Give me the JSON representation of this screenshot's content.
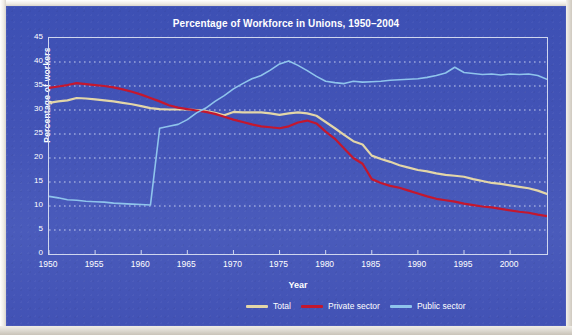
{
  "panel": {
    "background_color": "#4253b6",
    "frame_color": "#cfd6ef",
    "grid_color": "#ccd5f2"
  },
  "chart_data": {
    "type": "line",
    "title": "Percentage of Workforce in Unions, 1950–2004",
    "xlabel": "Year",
    "ylabel": "Percentage of workers",
    "xlim": [
      1950,
      2004
    ],
    "ylim": [
      0,
      45
    ],
    "ytick_labels": [
      "0",
      "5",
      "10",
      "15",
      "20",
      "25",
      "30",
      "35",
      "40",
      "45"
    ],
    "ytick_values": [
      0,
      5,
      10,
      15,
      20,
      25,
      30,
      35,
      40,
      45
    ],
    "xtick_labels": [
      "1950",
      "1955",
      "1960",
      "1965",
      "1970",
      "1975",
      "1980",
      "1985",
      "1990",
      "1995",
      "2000"
    ],
    "xtick_values": [
      1950,
      1955,
      1960,
      1965,
      1970,
      1975,
      1980,
      1985,
      1990,
      1995,
      2000
    ],
    "grid": "horizontal-dotted",
    "legend_position": "below-right",
    "x": [
      1950,
      1951,
      1952,
      1953,
      1954,
      1955,
      1956,
      1957,
      1958,
      1959,
      1960,
      1961,
      1962,
      1963,
      1964,
      1965,
      1966,
      1967,
      1968,
      1969,
      1970,
      1971,
      1972,
      1973,
      1974,
      1975,
      1976,
      1977,
      1978,
      1979,
      1980,
      1981,
      1982,
      1983,
      1984,
      1985,
      1986,
      1987,
      1988,
      1989,
      1990,
      1991,
      1992,
      1993,
      1994,
      1995,
      1996,
      1997,
      1998,
      1999,
      2000,
      2001,
      2002,
      2003,
      2004
    ],
    "series": [
      {
        "name": "Total",
        "color": "#e3d6a8",
        "values": [
          31.5,
          31.8,
          32.0,
          32.5,
          32.4,
          32.2,
          32.0,
          31.8,
          31.5,
          31.2,
          30.8,
          30.4,
          30.2,
          30.1,
          30.1,
          30.1,
          30.0,
          29.8,
          29.4,
          28.9,
          29.6,
          29.5,
          29.5,
          29.5,
          29.3,
          29.0,
          29.3,
          29.5,
          29.3,
          28.8,
          27.5,
          26.2,
          24.8,
          23.5,
          22.8,
          20.5,
          19.8,
          19.2,
          18.5,
          18.0,
          17.5,
          17.2,
          16.8,
          16.5,
          16.3,
          16.1,
          15.6,
          15.2,
          14.8,
          14.6,
          14.3,
          14.0,
          13.7,
          13.2,
          12.5
        ]
      },
      {
        "name": "Private sector",
        "color": "#c4172e",
        "values": [
          34.6,
          34.9,
          35.2,
          35.6,
          35.4,
          35.2,
          35.0,
          34.7,
          34.3,
          33.8,
          33.2,
          32.5,
          31.8,
          31.0,
          30.5,
          30.2,
          29.9,
          29.6,
          29.2,
          28.6,
          28.0,
          27.5,
          27.0,
          26.6,
          26.4,
          26.2,
          26.6,
          27.4,
          27.8,
          27.2,
          25.5,
          24.0,
          22.0,
          20.0,
          18.8,
          15.6,
          14.8,
          14.2,
          13.8,
          13.2,
          12.6,
          12.0,
          11.5,
          11.2,
          10.9,
          10.5,
          10.2,
          9.9,
          9.7,
          9.4,
          9.1,
          8.8,
          8.6,
          8.2,
          7.9
        ]
      },
      {
        "name": "Public sector",
        "color": "#8fc4ec",
        "values": [
          12.0,
          11.7,
          11.3,
          11.2,
          11.0,
          10.9,
          10.8,
          10.6,
          10.5,
          10.4,
          10.3,
          10.2,
          26.2,
          26.6,
          27.0,
          28.0,
          29.4,
          30.4,
          31.8,
          33.0,
          34.4,
          35.5,
          36.5,
          37.2,
          38.3,
          39.6,
          40.2,
          39.3,
          38.2,
          37.0,
          36.0,
          35.7,
          35.5,
          36.0,
          35.8,
          35.9,
          36.0,
          36.2,
          36.3,
          36.4,
          36.5,
          36.8,
          37.2,
          37.7,
          38.9,
          37.8,
          37.6,
          37.4,
          37.5,
          37.3,
          37.5,
          37.4,
          37.5,
          37.2,
          36.4
        ]
      }
    ]
  },
  "legend": {
    "items": [
      {
        "label": "Total",
        "color": "#e3d6a8"
      },
      {
        "label": "Private sector",
        "color": "#c4172e"
      },
      {
        "label": "Public sector",
        "color": "#8fc4ec"
      }
    ]
  }
}
